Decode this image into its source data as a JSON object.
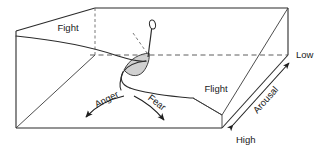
{
  "figure": {
    "type": "cusp-catastrophe-diagram",
    "background_color": "#ffffff",
    "line_color": "#2b2b2b",
    "shade_color": "#c9c9c9"
  },
  "labels": {
    "fight_back": "Fight",
    "flight_front": "Flight",
    "anger": "Anger",
    "fear": "Fear",
    "arousal": "Arousal",
    "arousal_low": "Low",
    "arousal_high": "High"
  },
  "axes": {
    "arousal": {
      "name": "Arousal",
      "low_end": "Low",
      "high_end": "High",
      "direction": "double-headed diagonal arrow on right face"
    }
  },
  "behaviours": [
    {
      "name": "Fight",
      "surface": "upper-sheet"
    },
    {
      "name": "Flight",
      "surface": "lower-sheet"
    }
  ],
  "transitions": [
    {
      "name": "Anger",
      "arrow": "curved-arrow-left-down"
    },
    {
      "name": "Fear",
      "arrow": "curved-arrow-right-down"
    }
  ],
  "annotations": {
    "cusp_shade": "shaded-fold-region",
    "pointer": "state-pointer-pin",
    "dashed_guides": "projection-lines"
  }
}
